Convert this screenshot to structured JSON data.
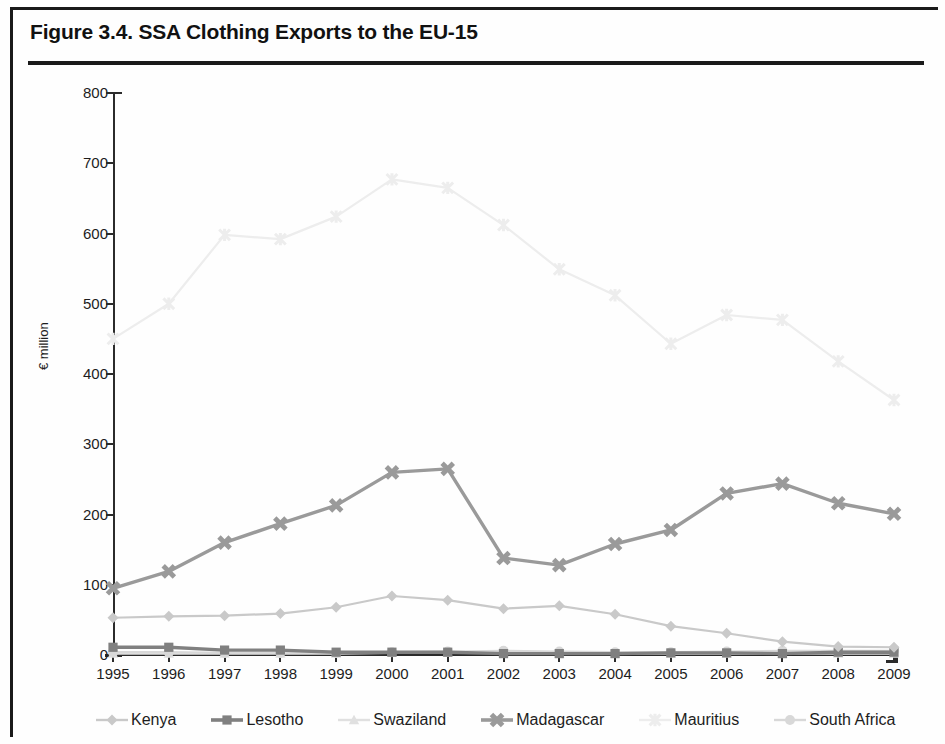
{
  "figure": {
    "title": "Figure 3.4. SSA Clothing Exports to the EU-15"
  },
  "chart_data": {
    "type": "line",
    "title": "Figure 3.4. SSA Clothing Exports to the EU-15",
    "xlabel": "",
    "ylabel": "€ million",
    "categories": [
      "1995",
      "1996",
      "1997",
      "1998",
      "1999",
      "2000",
      "2001",
      "2002",
      "2003",
      "2004",
      "2005",
      "2006",
      "2007",
      "2008",
      "2009"
    ],
    "x": [
      1995,
      1996,
      1997,
      1998,
      1999,
      2000,
      2001,
      2002,
      2003,
      2004,
      2005,
      2006,
      2007,
      2008,
      2009
    ],
    "ylim": [
      0,
      800
    ],
    "yticks": [
      0,
      100,
      200,
      300,
      400,
      500,
      600,
      700,
      800
    ],
    "grid": false,
    "legend_position": "bottom",
    "series": [
      {
        "name": "Kenya",
        "color": "#c9c9c9",
        "marker": "diamond",
        "values": [
          53,
          55,
          56,
          59,
          68,
          84,
          78,
          66,
          70,
          58,
          41,
          31,
          19,
          12,
          11
        ]
      },
      {
        "name": "Lesotho",
        "color": "#808080",
        "marker": "square",
        "values": [
          11,
          11,
          7,
          7,
          4,
          4,
          4,
          2,
          2,
          2,
          3,
          3,
          2,
          4,
          4
        ]
      },
      {
        "name": "Swaziland",
        "color": "#e0e0e0",
        "marker": "triangle",
        "values": [
          2,
          2,
          2,
          2,
          2,
          3,
          3,
          3,
          2,
          2,
          2,
          2,
          2,
          2,
          2
        ]
      },
      {
        "name": "Madagascar",
        "color": "#9a9a9a",
        "marker": "cross",
        "values": [
          95,
          119,
          160,
          187,
          213,
          260,
          265,
          138,
          128,
          158,
          178,
          230,
          244,
          216,
          201
        ]
      },
      {
        "name": "Mauritius",
        "color": "#ededed",
        "marker": "star",
        "values": [
          450,
          500,
          598,
          592,
          624,
          677,
          665,
          612,
          549,
          512,
          443,
          484,
          477,
          418,
          363
        ]
      },
      {
        "name": "South Africa",
        "color": "#d8d8d8",
        "marker": "circle",
        "values": [
          4,
          4,
          3,
          3,
          3,
          4,
          5,
          6,
          5,
          4,
          4,
          5,
          6,
          6,
          6
        ]
      }
    ]
  },
  "axes": {
    "y_ticks": [
      "800",
      "700",
      "600",
      "500",
      "400",
      "300",
      "200",
      "100",
      "0"
    ],
    "y_axis_title": "€ million",
    "x_ticks": [
      "1995",
      "1996",
      "1997",
      "1998",
      "1999",
      "2000",
      "2001",
      "2002",
      "2003",
      "2004",
      "2005",
      "2006",
      "2007",
      "2008",
      "2009"
    ]
  },
  "legend": {
    "items": [
      {
        "label": "Kenya"
      },
      {
        "label": "Lesotho"
      },
      {
        "label": "Swaziland"
      },
      {
        "label": "Madagascar"
      },
      {
        "label": "Mauritius"
      },
      {
        "label": "South Africa"
      }
    ]
  }
}
